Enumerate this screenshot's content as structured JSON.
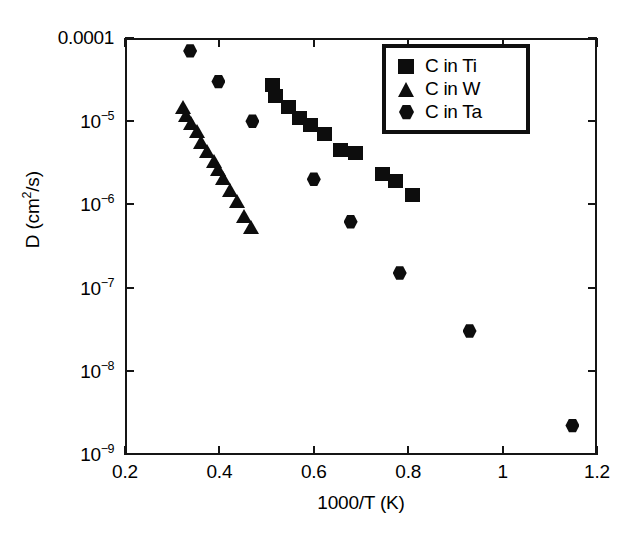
{
  "chart_data": {
    "type": "scatter",
    "title": "",
    "xlabel": "1000/T (K)",
    "ylabel": "D (cm2/s)",
    "ylabel_display": "D (cm²/s)",
    "xlim": [
      0.2,
      1.2
    ],
    "ylim": [
      1e-09,
      0.0001
    ],
    "yscale": "log",
    "xscale": "linear",
    "grid": false,
    "legend_position": "top-right",
    "xticks": [
      0.2,
      0.4,
      0.6,
      0.8,
      1,
      1.2
    ],
    "xtick_labels": [
      "0.2",
      "0.4",
      "0.6",
      "0.8",
      "1",
      "1.2"
    ],
    "yticks": [
      0.0001,
      1e-05,
      1e-06,
      1e-07,
      1e-08,
      1e-09
    ],
    "ytick_labels": [
      "0.0001",
      "10-5",
      "10-6",
      "10-7",
      "10-8",
      "10-9"
    ],
    "ytick_mantissa": [
      "0.0001",
      "10",
      "10",
      "10",
      "10",
      "10"
    ],
    "ytick_exponent": [
      "",
      "-5",
      "-6",
      "-7",
      "-8",
      "-9"
    ],
    "series": [
      {
        "name": "C in Ti",
        "marker": "square",
        "color": "#0d0d0d",
        "points": [
          [
            0.512,
            2.7e-05
          ],
          [
            0.518,
            2e-05
          ],
          [
            0.545,
            1.5e-05
          ],
          [
            0.568,
            1.1e-05
          ],
          [
            0.592,
            9e-06
          ],
          [
            0.621,
            7e-06
          ],
          [
            0.655,
            4.5e-06
          ],
          [
            0.688,
            4.2e-06
          ],
          [
            0.744,
            2.3e-06
          ],
          [
            0.772,
            1.9e-06
          ],
          [
            0.808,
            1.3e-06
          ]
        ]
      },
      {
        "name": "C in W",
        "marker": "triangle",
        "color": "#0d0d0d",
        "points": [
          [
            0.322,
            1.5e-05
          ],
          [
            0.33,
            1.2e-05
          ],
          [
            0.34,
            9.5e-06
          ],
          [
            0.352,
            7.6e-06
          ],
          [
            0.362,
            5.6e-06
          ],
          [
            0.374,
            4.4e-06
          ],
          [
            0.388,
            3.3e-06
          ],
          [
            0.398,
            2.7e-06
          ],
          [
            0.408,
            2.1e-06
          ],
          [
            0.422,
            1.5e-06
          ],
          [
            0.438,
            1.1e-06
          ],
          [
            0.452,
            7.2e-07
          ],
          [
            0.466,
            5.3e-07
          ]
        ]
      },
      {
        "name": "C in Ta",
        "marker": "hexagon",
        "color": "#0d0d0d",
        "points": [
          [
            0.338,
            7e-05
          ],
          [
            0.398,
            3e-05
          ],
          [
            0.47,
            1e-05
          ],
          [
            0.6,
            2e-06
          ],
          [
            0.678,
            6.2e-07
          ],
          [
            0.782,
            1.5e-07
          ],
          [
            0.93,
            3e-08
          ],
          [
            1.148,
            2.2e-09
          ]
        ]
      }
    ]
  },
  "legend": {
    "items": [
      {
        "label": "C in Ti",
        "marker": "square"
      },
      {
        "label": "C in W",
        "marker": "triangle"
      },
      {
        "label": "C in Ta",
        "marker": "hexagon"
      }
    ]
  }
}
